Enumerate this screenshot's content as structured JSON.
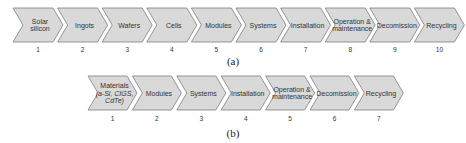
{
  "diagram_a": {
    "caption": "(a)",
    "steps": [
      {
        "n": "1",
        "lines": [
          "Solar",
          "silicon"
        ]
      },
      {
        "n": "2",
        "lines": [
          "Ingots"
        ]
      },
      {
        "n": "3",
        "lines": [
          "Wafers"
        ]
      },
      {
        "n": "4",
        "lines": [
          "Cells"
        ]
      },
      {
        "n": "5",
        "lines": [
          "Modules"
        ]
      },
      {
        "n": "6",
        "lines": [
          "Systems"
        ]
      },
      {
        "n": "7",
        "lines": [
          "Installation"
        ]
      },
      {
        "n": "8",
        "lines": [
          "Operation &",
          "maintenance"
        ]
      },
      {
        "n": "9",
        "lines": [
          "Decomission"
        ]
      },
      {
        "n": "10",
        "lines": [
          "Recycling"
        ]
      }
    ]
  },
  "diagram_b": {
    "caption": "(b)",
    "steps": [
      {
        "n": "1",
        "lines": [
          "Materials",
          "(a-Si, CIGS,",
          "CdTe)"
        ]
      },
      {
        "n": "2",
        "lines": [
          "Modules"
        ]
      },
      {
        "n": "3",
        "lines": [
          "Systems"
        ]
      },
      {
        "n": "4",
        "lines": [
          "Installation"
        ]
      },
      {
        "n": "5",
        "lines": [
          "Operation &",
          "maintenance"
        ]
      },
      {
        "n": "6",
        "lines": [
          "Decomission"
        ]
      },
      {
        "n": "7",
        "lines": [
          "Recycling"
        ]
      }
    ]
  },
  "colors": {
    "fill": "#d9d9d9",
    "stroke": "#7f7f7f",
    "text": "#333333"
  }
}
